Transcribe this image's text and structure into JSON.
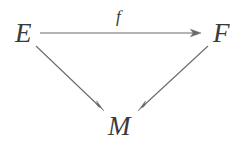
{
  "figure": {
    "kind": "commutative-diagram",
    "shape": "triangle",
    "background_color": "#ffffff",
    "stroke_color": "#6a6a6a",
    "text_color": "#3a3a3a"
  },
  "nodes": [
    {
      "id": "E",
      "label": "E",
      "x": 27,
      "y": 33
    },
    {
      "id": "F",
      "label": "F",
      "x": 223,
      "y": 33
    },
    {
      "id": "M",
      "label": "M",
      "x": 122,
      "y": 126
    }
  ],
  "edges": [
    {
      "id": "E-to-F",
      "from": "E",
      "to": "F",
      "label": "f",
      "label_x": 121,
      "label_y": 18,
      "x1": 40,
      "y1": 33,
      "x2": 201,
      "y2": 33,
      "arrowhead": "end"
    },
    {
      "id": "E-to-M",
      "from": "E",
      "to": "M",
      "label": "",
      "x1": 36,
      "y1": 46,
      "x2": 104,
      "y2": 111,
      "arrowhead": "end"
    },
    {
      "id": "F-to-M",
      "from": "F",
      "to": "M",
      "label": "",
      "x1": 208,
      "y1": 46,
      "x2": 138,
      "y2": 111,
      "arrowhead": "end"
    }
  ]
}
